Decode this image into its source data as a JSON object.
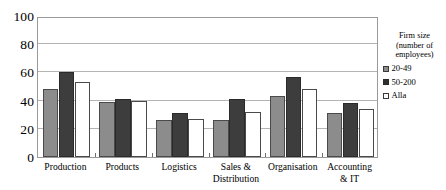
{
  "chart_data": {
    "type": "bar",
    "title": "",
    "xlabel": "",
    "ylabel": "",
    "ylim": [
      0,
      100
    ],
    "yticks": [
      0,
      20,
      40,
      60,
      80,
      100
    ],
    "grid": "horizontal",
    "legend_position": "right",
    "legend_title": "Firm size\n(number of\nemployees)",
    "categories": [
      "Production",
      "Products",
      "Logistics",
      "Sales &\nDistribution",
      "Organisation",
      "Accounting\n& IT"
    ],
    "series": [
      {
        "name": "20-49",
        "color": "#8c8c8c",
        "values": [
          48,
          39,
          26,
          26,
          43,
          31
        ]
      },
      {
        "name": "50-200",
        "color": "#3d3d3d",
        "values": [
          60,
          41,
          31,
          41,
          57,
          38
        ]
      },
      {
        "name": "Alla",
        "color": "#ffffff",
        "values": [
          53,
          40,
          27,
          32,
          48,
          34
        ]
      }
    ]
  }
}
